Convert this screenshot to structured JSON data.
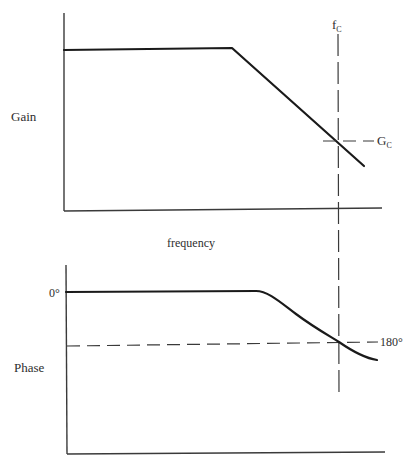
{
  "diagram": {
    "type": "bode-plot",
    "gain_plot": {
      "y_label": "Gain",
      "crossover_freq_label": "f",
      "crossover_freq_subscript": "C",
      "crossover_gain_label": "G",
      "crossover_gain_subscript": "C",
      "curve_description": "flat then linear roll-off"
    },
    "x_label": "frequency",
    "phase_plot": {
      "y_label": "Phase",
      "zero_tick_label": "0°",
      "crossover_phase_label": "180°",
      "curve_description": "flat at 0° then smooth decline passing through 180° at f_C"
    }
  },
  "colors": {
    "background": "#ffffff",
    "line": "#1a1a1a",
    "text": "#2e2e2e"
  }
}
